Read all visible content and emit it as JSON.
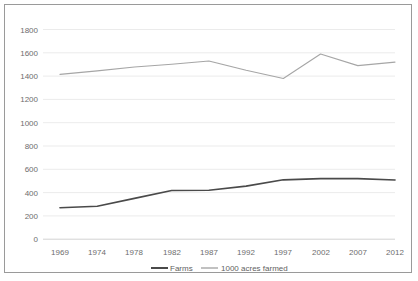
{
  "chart_data": {
    "type": "line",
    "title": "",
    "xlabel": "",
    "ylabel": "",
    "x": [
      1969,
      1974,
      1978,
      1982,
      1987,
      1992,
      1997,
      2002,
      2007,
      2012
    ],
    "categories": [
      "1969",
      "1974",
      "1978",
      "1982",
      "1987",
      "1992",
      "1997",
      "2002",
      "2007",
      "2012"
    ],
    "series": [
      {
        "name": "Farms",
        "color": "#4a4a4a",
        "values": [
          270,
          283,
          350,
          418,
          420,
          455,
          510,
          520,
          520,
          508
        ]
      },
      {
        "name": "1000 acres farmed",
        "color": "#a6a6a6",
        "values": [
          1415,
          1445,
          1478,
          1502,
          1530,
          1450,
          1380,
          1590,
          1490,
          1520
        ]
      }
    ],
    "ylim": [
      0,
      1800
    ],
    "ytick_step": 200,
    "yticks": [
      "0",
      "200",
      "400",
      "600",
      "800",
      "1000",
      "1200",
      "1400",
      "1600",
      "1800"
    ],
    "grid": true,
    "legend_position": "bottom",
    "legend": [
      "Farms",
      "1000 acres farmed"
    ]
  },
  "legend": {
    "farms_label": "Farms",
    "acres_label": "1000 acres farmed"
  },
  "axis": {
    "y": {
      "t0": "0",
      "t1": "200",
      "t2": "400",
      "t3": "600",
      "t4": "800",
      "t5": "1000",
      "t6": "1200",
      "t7": "1400",
      "t8": "1600",
      "t9": "1800"
    },
    "x": {
      "t0": "1969",
      "t1": "1974",
      "t2": "1978",
      "t3": "1982",
      "t4": "1987",
      "t5": "1992",
      "t6": "1997",
      "t7": "2002",
      "t8": "2007",
      "t9": "2012"
    }
  }
}
